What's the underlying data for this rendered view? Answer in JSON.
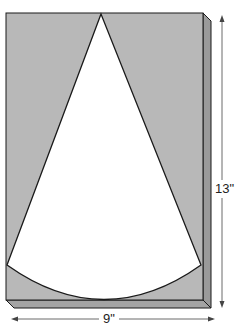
{
  "diagram": {
    "dimensions": {
      "height_label": "13\"",
      "width_label": "9\""
    },
    "colors": {
      "board_face": "#b8b8b8",
      "board_side": "#9a9a9a",
      "board_bottom": "#a4a4a4",
      "cutout": "#ffffff",
      "outline": "#1a1a1a",
      "dimension_line": "#444444"
    }
  }
}
